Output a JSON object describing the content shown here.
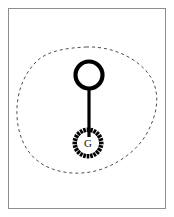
{
  "figure": {
    "background_color": "#ffffff",
    "frame": {
      "border_color": "#8e8e8e",
      "fill_color": "#ffffff"
    },
    "region_outline": {
      "name": "dashed-region-boundary",
      "style": "dashed",
      "stroke_color": "#3a3a3a",
      "dash_pattern": "3 3",
      "stroke_width": 0.9,
      "path": "M 86 47 C 112 46 138 58 150 76 C 160 91 158 110 150 127 C 142 146 124 161 102 169 C 82 176 58 174 42 164 C 26 154 18 136 17 116 C 16 96 22 75 38 60 C 50 50 68 48 86 47 Z"
    },
    "ring": {
      "name": "open-circle-node",
      "center_x": 89,
      "center_y": 75,
      "radius": 13.5,
      "stroke_color": "#000000",
      "stroke_width": 4.2,
      "fill": "none"
    },
    "stem": {
      "name": "connector-stem",
      "x": 89,
      "y_top": 89,
      "y_bottom": 137,
      "stroke_color": "#000000",
      "stroke_width": 3.2
    },
    "dotted_ring": {
      "name": "radial-dashed-circle",
      "center_x": 88,
      "center_y": 143,
      "inner_radius": 11,
      "outer_radius": 15.5,
      "tick_count": 24,
      "stroke_color": "#000000",
      "tick_width": 2.6
    },
    "node_label": {
      "name": "g-label",
      "text": "G",
      "color": "#111111",
      "x": 88,
      "y": 147
    }
  }
}
